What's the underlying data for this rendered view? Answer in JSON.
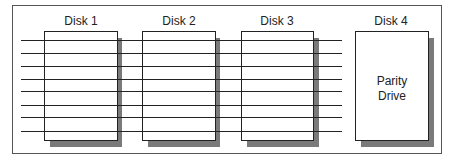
{
  "disks": [
    {
      "label": "Disk 1"
    },
    {
      "label": "Disk 2"
    },
    {
      "label": "Disk 3"
    },
    {
      "label": "Disk 4"
    }
  ],
  "parity": {
    "line1": "Parity",
    "line2": "Drive"
  },
  "stripe_count": 8
}
